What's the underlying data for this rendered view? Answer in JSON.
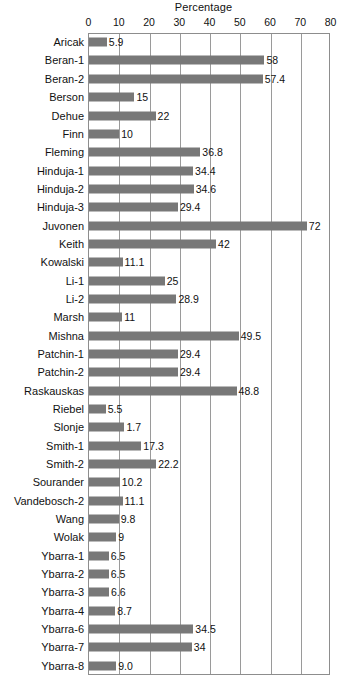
{
  "chart_data": {
    "type": "bar",
    "orientation": "horizontal",
    "title": "Percentage",
    "xlabel": "Percentage",
    "ylabel": "",
    "xlim": [
      0,
      80
    ],
    "xticks": [
      0,
      10,
      20,
      30,
      40,
      50,
      60,
      70,
      80
    ],
    "xtick_labels": [
      "0",
      "10",
      "20",
      "30",
      "40",
      "50",
      "60",
      "70",
      "80"
    ],
    "grid": "vertical",
    "legend": "none",
    "bar_color": "#787878",
    "categories": [
      "Aricak",
      "Beran-1",
      "Beran-2",
      "Berson",
      "Dehue",
      "Finn",
      "Fleming",
      "Hinduja-1",
      "Hinduja-2",
      "Hinduja-3",
      "Juvonen",
      "Keith",
      "Kowalski",
      "Li-1",
      "Li-2",
      "Marsh",
      "Mishna",
      "Patchin-1",
      "Patchin-2",
      "Raskauskas",
      "Riebel",
      "Slonje",
      "Smith-1",
      "Smith-2",
      "Sourander",
      "Vandebosch-2",
      "Wang",
      "Wolak",
      "Ybarra-1",
      "Ybarra-2",
      "Ybarra-3",
      "Ybarra-4",
      "Ybarra-6",
      "Ybarra-7",
      "Ybarra-8"
    ],
    "values": [
      5.9,
      58,
      57.4,
      15,
      22,
      10,
      36.8,
      34.4,
      34.6,
      29.4,
      72,
      42,
      11.1,
      25,
      28.9,
      11,
      49.5,
      29.4,
      29.4,
      48.8,
      5.5,
      11.7,
      17.3,
      22.2,
      10.2,
      11.1,
      9.8,
      9,
      6.5,
      6.5,
      6.6,
      8.7,
      34.5,
      34,
      9.0
    ],
    "value_labels": [
      "5.9",
      "58",
      "57.4",
      "15",
      "22",
      "10",
      "36.8",
      "34.4",
      "34.6",
      "29.4",
      "72",
      "42",
      "11.1",
      "25",
      "28.9",
      "11",
      "49.5",
      "29.4",
      "29.4",
      "48.8",
      "5.5",
      "1.7",
      "17.3",
      "22.2",
      "10.2",
      "11.1",
      "9.8",
      "9",
      "6.5",
      "6.5",
      "6.6",
      "8.7",
      "34.5",
      "34",
      "9.0"
    ]
  }
}
